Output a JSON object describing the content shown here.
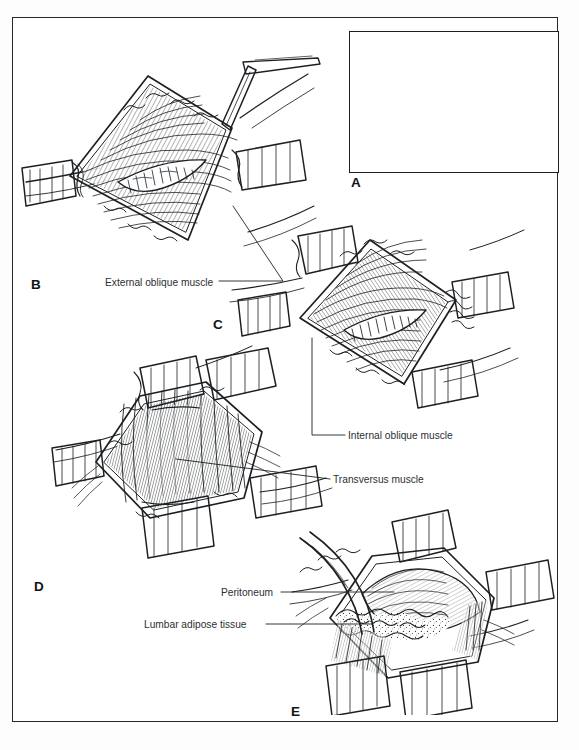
{
  "figure": {
    "border_color": "#26292c",
    "ink_color": "#1d2023",
    "paper_color": "#ffffff"
  },
  "panels": [
    {
      "id": "A",
      "letter": "A",
      "role": "inset-orientation-diagram",
      "description": "Boxed inset showing surface orientation with dashed vertical incision line between ribs and iliac crest",
      "letter_x": 351,
      "letter_y": 176,
      "frame": {
        "x": 349,
        "y": 31,
        "w": 210,
        "h": 142
      }
    },
    {
      "id": "B",
      "letter": "B",
      "role": "external-oblique-exposure",
      "description": "Wound opened with retractors exposing external oblique muscle fibers; scalpel at upper right",
      "letter_x": 31,
      "letter_y": 278
    },
    {
      "id": "C",
      "letter": "C",
      "role": "internal-oblique-exposure",
      "description": "Deeper exposure with four retractors showing internal oblique muscle and a split in the fibers",
      "letter_x": 213,
      "letter_y": 318
    },
    {
      "id": "D",
      "letter": "D",
      "role": "transversus-exposure",
      "description": "Transversus abdominis muscle exposed in the depth of the wound between retractor blades",
      "letter_x": 34,
      "letter_y": 580
    },
    {
      "id": "E",
      "letter": "E",
      "role": "peritoneum-and-fat-exposure",
      "description": "Deepest layer: peritoneum bulging with lumbar adipose tissue at the wound edge, retractors in place",
      "letter_x": 291,
      "letter_y": 705
    }
  ],
  "labels": [
    {
      "id": "external-oblique",
      "text": "External oblique muscle",
      "x": 105,
      "y": 278,
      "leader": "from label right edge up-right to panel B muscle belly"
    },
    {
      "id": "internal-oblique",
      "text": "Internal oblique muscle",
      "x": 348,
      "y": 432,
      "leader": "from label left edge left then up into panel C muscle"
    },
    {
      "id": "transversus",
      "text": "Transversus muscle",
      "x": 333,
      "y": 476,
      "leader": "from label left edge straight left into panel D muscle"
    },
    {
      "id": "peritoneum",
      "text": "Peritoneum",
      "x": 221,
      "y": 589,
      "leader": "from label right edge right into panel E peritoneum"
    },
    {
      "id": "lumbar-adipose-tissue",
      "text": "Lumbar adipose tissue",
      "x": 144,
      "y": 621,
      "leader": "from label right edge right into panel E fat"
    }
  ]
}
